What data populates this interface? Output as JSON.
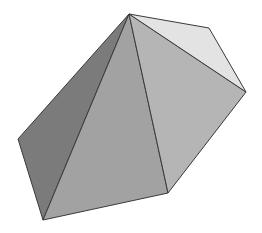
{
  "figure": {
    "width": 262,
    "height": 233,
    "background": "#ffffff",
    "edge_color": "#3a3a3a",
    "vertices": {
      "top": [
        129,
        14
      ],
      "upper_right": [
        209,
        28
      ],
      "right": [
        246,
        92
      ],
      "lower_right": [
        168,
        193
      ],
      "bottom": [
        43,
        220
      ],
      "left": [
        18,
        139
      ]
    },
    "faces": [
      {
        "name": "left-face",
        "points": "129,14 18,139 43,220",
        "fill": "#7b7b7b"
      },
      {
        "name": "front-face",
        "points": "129,14 43,220 168,193",
        "fill": "#a2a2a2"
      },
      {
        "name": "right-face",
        "points": "129,14 168,193 246,92",
        "fill": "#b5b5b5"
      },
      {
        "name": "top-right-face",
        "points": "129,14 246,92 209,28",
        "fill": "#e3e3e3"
      }
    ]
  }
}
